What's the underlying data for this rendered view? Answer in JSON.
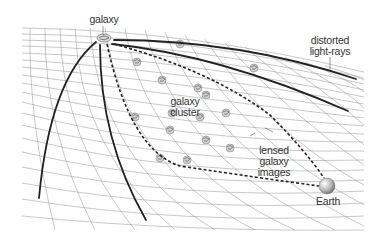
{
  "diagram": {
    "type": "gravitational-lensing-illustration",
    "labels": {
      "source_galaxy": "galaxy",
      "light_rays": [
        "distorted",
        "light-rays"
      ],
      "cluster": [
        "galaxy",
        "cluster"
      ],
      "lensed_images": [
        "lensed",
        "galaxy",
        "images"
      ],
      "observer": "Earth"
    },
    "colors": {
      "grid": "#9a9a9a",
      "rays": "#222222",
      "dashed_path": "#222222",
      "text": "#333333",
      "earth": "#bdbdbd"
    }
  }
}
